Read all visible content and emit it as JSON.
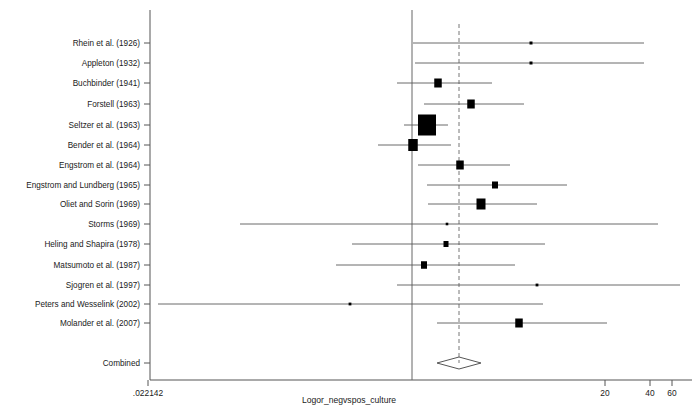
{
  "chart_data": {
    "type": "forest",
    "title": "",
    "xlabel": "Logor_negvspos_culture",
    "ylabel": "",
    "scale": "log",
    "null_line_value": 1,
    "pooled_line_style": "dashed",
    "axis": {
      "ticks": [
        {
          "label": ".022142",
          "x_px": 148
        },
        {
          "label": "20",
          "x_px": 605
        },
        {
          "label": "40",
          "x_px": 650
        },
        {
          "label": "60",
          "x_px": 672
        }
      ],
      "plot_left_px": 150,
      "plot_right_px": 692,
      "null_line_px": 412,
      "pooled_line_px": 459
    },
    "studies": [
      {
        "label": "Rhein et al. (1926)",
        "y_px": 43,
        "est_px": 531,
        "lo_px": 413,
        "hi_px": 644,
        "box_w": 3.0,
        "box_h": 3.0
      },
      {
        "label": "Appleton (1932)",
        "y_px": 63,
        "est_px": 531,
        "lo_px": 415,
        "hi_px": 644,
        "box_w": 3.0,
        "box_h": 3.0
      },
      {
        "label": "Buchbinder (1941)",
        "y_px": 83,
        "est_px": 438,
        "lo_px": 397,
        "hi_px": 492,
        "box_w": 7.5,
        "box_h": 9.0
      },
      {
        "label": "Forstell (1963)",
        "y_px": 104,
        "est_px": 471,
        "lo_px": 424,
        "hi_px": 524,
        "box_w": 7.5,
        "box_h": 9.0
      },
      {
        "label": "Seltzer et al. (1963)",
        "y_px": 125,
        "est_px": 427,
        "lo_px": 404,
        "hi_px": 448,
        "box_w": 18.0,
        "box_h": 21.0
      },
      {
        "label": "Bender et al. (1964)",
        "y_px": 145,
        "est_px": 413,
        "lo_px": 378,
        "hi_px": 451,
        "box_w": 9.5,
        "box_h": 12.0
      },
      {
        "label": "Engstrom et al. (1964)",
        "y_px": 165,
        "est_px": 460,
        "lo_px": 418,
        "hi_px": 510,
        "box_w": 7.5,
        "box_h": 9.0
      },
      {
        "label": "Engstrom and Lundberg (1965)",
        "y_px": 185,
        "est_px": 495,
        "lo_px": 427,
        "hi_px": 567,
        "box_w": 6.0,
        "box_h": 7.0
      },
      {
        "label": "Oliet and Sorin (1969)",
        "y_px": 204,
        "est_px": 481,
        "lo_px": 428,
        "hi_px": 537,
        "box_w": 9.0,
        "box_h": 11.0
      },
      {
        "label": "Storms (1969)",
        "y_px": 224,
        "est_px": 447,
        "lo_px": 240,
        "hi_px": 658,
        "box_w": 2.6,
        "box_h": 2.6
      },
      {
        "label": "Heling and Shapira (1978)",
        "y_px": 244,
        "est_px": 446,
        "lo_px": 352,
        "hi_px": 545,
        "box_w": 5.0,
        "box_h": 6.0
      },
      {
        "label": "Matsumoto et al. (1987)",
        "y_px": 265,
        "est_px": 424,
        "lo_px": 336,
        "hi_px": 515,
        "box_w": 6.0,
        "box_h": 7.5
      },
      {
        "label": "Sjogren et al. (1997)",
        "y_px": 285,
        "est_px": 537,
        "lo_px": 397,
        "hi_px": 680,
        "box_w": 2.8,
        "box_h": 2.8
      },
      {
        "label": "Peters and Wesselink (2002)",
        "y_px": 304,
        "est_px": 350,
        "lo_px": 158,
        "hi_px": 543,
        "box_w": 2.8,
        "box_h": 2.8
      },
      {
        "label": "Molander et al. (2007)",
        "y_px": 323,
        "est_px": 519,
        "lo_px": 437,
        "hi_px": 607,
        "box_w": 7.5,
        "box_h": 9.0
      }
    ],
    "combined": {
      "label": "Combined",
      "y_px": 363,
      "center_px": 459,
      "lo_px": 437,
      "hi_px": 481,
      "half_height_px": 6
    }
  }
}
